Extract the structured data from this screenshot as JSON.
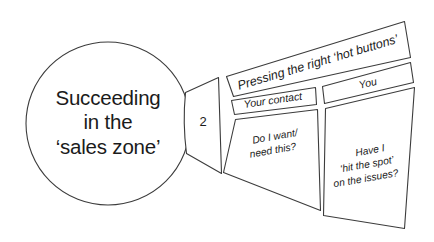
{
  "diagram": {
    "background_color": "#ffffff",
    "line_color": "#3c3c3c",
    "text_color": "#1b1b1b",
    "circle": {
      "line1": "Succeeding",
      "line2": "in the",
      "line3": "‘sales zone’"
    },
    "wedge": {
      "number": "2"
    },
    "band": {
      "title": "Pressing the right ‘hot buttons’"
    },
    "columns": [
      {
        "header": "Your contact",
        "body_line1": "Do I want/",
        "body_line2": "need this?"
      },
      {
        "header": "You",
        "body_line1": "Have I",
        "body_line2": "‘hit the spot’",
        "body_line3": "on the issues?"
      }
    ]
  }
}
